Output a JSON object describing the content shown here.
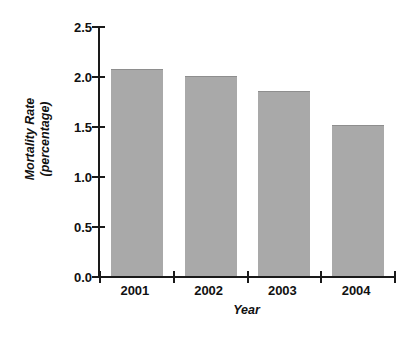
{
  "chart_data": {
    "type": "bar",
    "title": "",
    "subtitle": "",
    "xlabel": "Year",
    "ylabel_line1": "Mortality Rate",
    "ylabel_line2": "(percentage)",
    "ylabel": "Mortality Rate (percentage)",
    "categories": [
      "2001",
      "2002",
      "2003",
      "2004"
    ],
    "values": [
      2.07,
      2.0,
      1.85,
      1.51
    ],
    "ylim": [
      0.0,
      2.5
    ],
    "ytick_labels": [
      "0.0",
      "0.5",
      "1.0",
      "1.5",
      "2.0",
      "2.5"
    ],
    "ytick_values": [
      0.0,
      0.5,
      1.0,
      1.5,
      2.0,
      2.5
    ],
    "grid": false,
    "legend": false,
    "legend_position": "none",
    "bar_color": "#a9a9a9",
    "bar_edge_color": "#8e8e8e",
    "axis_color": "#1a1a1a",
    "text_color": "#111111",
    "background_color": "#ffffff"
  }
}
